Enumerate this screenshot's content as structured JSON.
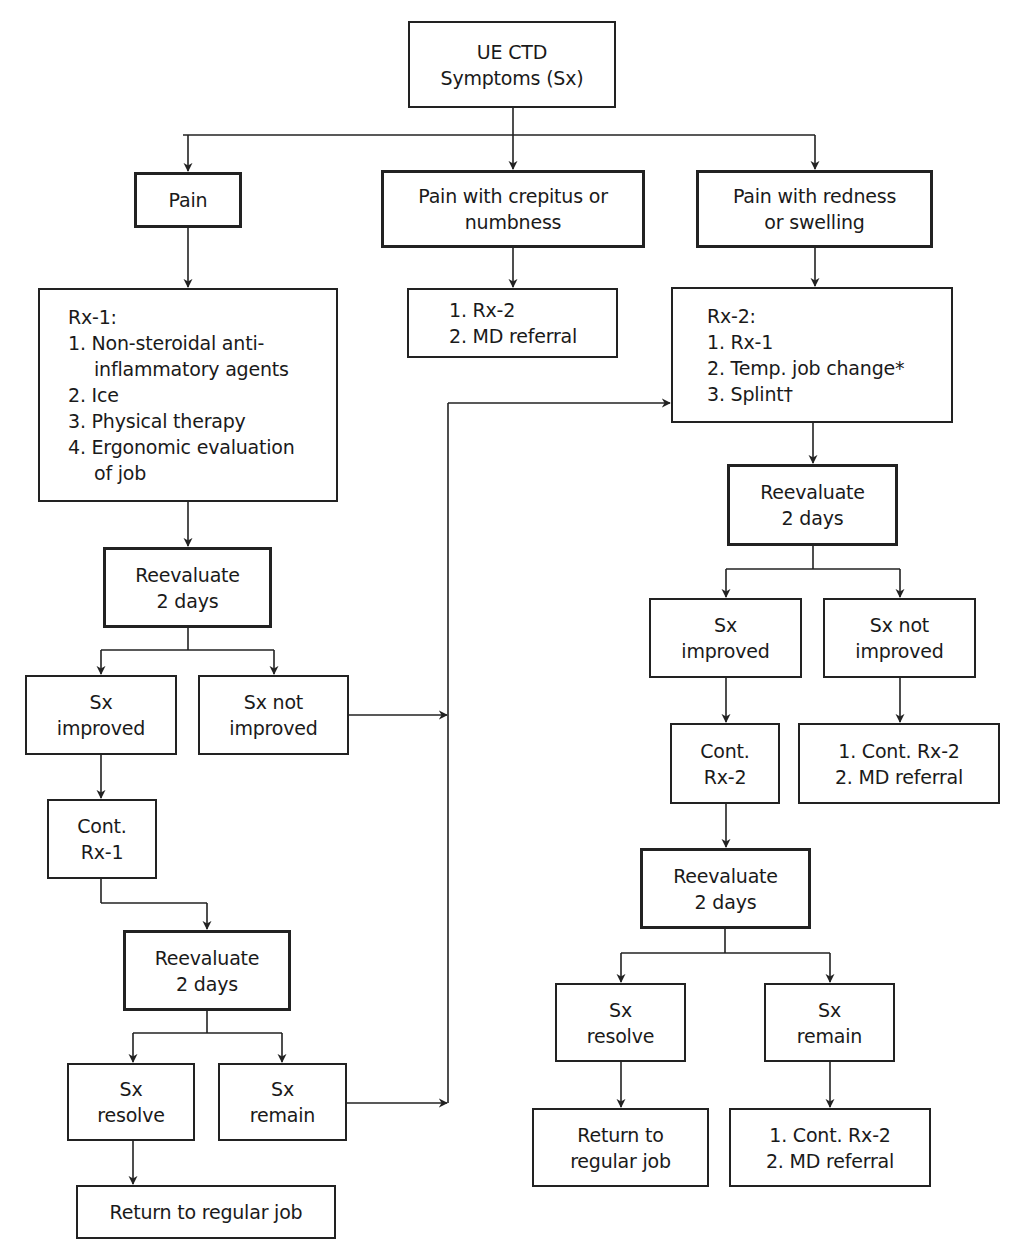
{
  "diagram": {
    "title_node": {
      "lines": [
        "UE CTD",
        "Symptoms (Sx)"
      ]
    },
    "branches": {
      "pain": {
        "label": [
          "Pain"
        ],
        "treatment": {
          "lines": [
            "Rx-1:",
            "1. Non-steroidal anti-",
            "inflammatory agents",
            "2. Ice",
            "3. Physical therapy",
            "4. Ergonomic evaluation",
            "of job"
          ]
        },
        "reevaluate_1": {
          "lines": [
            "Reevaluate",
            "2 days"
          ]
        },
        "improved": {
          "lines": [
            "Sx",
            "improved"
          ]
        },
        "not_improved": {
          "lines": [
            "Sx not",
            "improved"
          ]
        },
        "continue": {
          "lines": [
            "Cont.",
            "Rx-1"
          ]
        },
        "reevaluate_2": {
          "lines": [
            "Reevaluate",
            "2 days"
          ]
        },
        "resolve": {
          "lines": [
            "Sx",
            "resolve"
          ]
        },
        "remain": {
          "lines": [
            "Sx",
            "remain"
          ]
        },
        "outcome": {
          "lines": [
            "Return to regular job"
          ]
        }
      },
      "crepitus": {
        "label": [
          "Pain with crepitus or",
          "numbness"
        ],
        "treatment": {
          "lines": [
            "1. Rx-2",
            "2. MD referral"
          ]
        }
      },
      "redness": {
        "label": [
          "Pain with redness",
          "or swelling"
        ],
        "treatment": {
          "lines": [
            "Rx-2:",
            "1. Rx-1",
            "2. Temp. job change*",
            "3. Splint†"
          ]
        },
        "reevaluate_1": {
          "lines": [
            "Reevaluate",
            "2 days"
          ]
        },
        "improved": {
          "lines": [
            "Sx",
            "improved"
          ]
        },
        "not_improved": {
          "lines": [
            "Sx not",
            "improved"
          ]
        },
        "continue": {
          "lines": [
            "Cont.",
            "Rx-2"
          ]
        },
        "not_improved_action": {
          "lines": [
            "1. Cont. Rx-2",
            "2. MD referral"
          ]
        },
        "reevaluate_2": {
          "lines": [
            "Reevaluate",
            "2 days"
          ]
        },
        "resolve": {
          "lines": [
            "Sx",
            "resolve"
          ]
        },
        "remain": {
          "lines": [
            "Sx",
            "remain"
          ]
        },
        "outcome_resolve": {
          "lines": [
            "Return to",
            "regular job"
          ]
        },
        "outcome_remain": {
          "lines": [
            "1. Cont. Rx-2",
            "2. MD referral"
          ]
        }
      }
    },
    "colors": {
      "line": "#222222",
      "background": "#ffffff"
    }
  }
}
